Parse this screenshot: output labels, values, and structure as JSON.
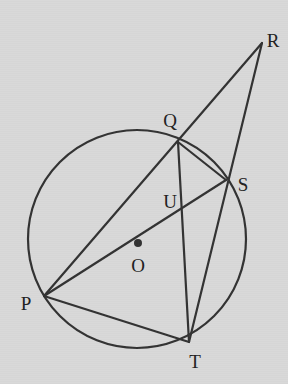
{
  "figure": {
    "type": "euclidean-geometry-diagram",
    "background_color": "#d9d9d9",
    "stroke_color": "#333333",
    "label_color": "#222222",
    "width": 288,
    "height": 384
  },
  "circle": {
    "name": "circumscribed-circle",
    "center_x": 137,
    "center_y": 239,
    "radius": 109,
    "stroke_width": 2.2
  },
  "center_marker": {
    "name": "center-dot",
    "x": 138,
    "y": 243,
    "radius": 4
  },
  "points": [
    {
      "id": "P",
      "label": "P",
      "x": 44,
      "y": 296,
      "label_x": 26,
      "label_y": 303,
      "on_circle": true
    },
    {
      "id": "Q",
      "label": "Q",
      "x": 178,
      "y": 142,
      "label_x": 170,
      "label_y": 120,
      "on_circle": true
    },
    {
      "id": "S",
      "label": "S",
      "x": 226,
      "y": 180,
      "label_x": 243,
      "label_y": 184,
      "on_circle": true
    },
    {
      "id": "T",
      "label": "T",
      "x": 189,
      "y": 342,
      "label_x": 195,
      "label_y": 361,
      "on_circle": true
    },
    {
      "id": "R",
      "label": "R",
      "x": 262,
      "y": 43,
      "label_x": 273,
      "label_y": 40,
      "on_circle": false
    },
    {
      "id": "U",
      "label": "U",
      "x": 180,
      "y": 208,
      "label_x": 170,
      "label_y": 201,
      "on_circle": false
    },
    {
      "id": "O",
      "label": "O",
      "x": 138,
      "y": 243,
      "label_x": 138,
      "label_y": 265,
      "on_circle": false
    }
  ],
  "segments": [
    {
      "name": "segment-P-R",
      "from": "P",
      "to": "R",
      "x1": 44,
      "y1": 296,
      "x2": 262,
      "y2": 43
    },
    {
      "name": "segment-T-R",
      "from": "T",
      "to": "R",
      "x1": 189,
      "y1": 342,
      "x2": 262,
      "y2": 43
    },
    {
      "name": "segment-P-S",
      "from": "P",
      "to": "S",
      "x1": 44,
      "y1": 296,
      "x2": 226,
      "y2": 180
    },
    {
      "name": "segment-Q-T",
      "from": "Q",
      "to": "T",
      "x1": 178,
      "y1": 142,
      "x2": 189,
      "y2": 342
    },
    {
      "name": "segment-P-T",
      "from": "P",
      "to": "T",
      "x1": 44,
      "y1": 296,
      "x2": 189,
      "y2": 342
    },
    {
      "name": "segment-Q-S",
      "from": "Q",
      "to": "S",
      "x1": 178,
      "y1": 142,
      "x2": 226,
      "y2": 180
    }
  ],
  "chart_data": {
    "type": "diagram",
    "title": "",
    "circle": {
      "center": [
        137,
        239
      ],
      "radius": 109,
      "center_label": "O"
    },
    "points_on_circle": [
      "P",
      "Q",
      "S",
      "T"
    ],
    "interior_points": [
      "O",
      "U"
    ],
    "exterior_points": [
      "R"
    ],
    "coordinates": {
      "P": [
        44,
        296
      ],
      "Q": [
        178,
        142
      ],
      "S": [
        226,
        180
      ],
      "T": [
        189,
        342
      ],
      "R": [
        262,
        43
      ],
      "U": [
        180,
        208
      ],
      "O": [
        138,
        243
      ]
    },
    "connections": [
      [
        "P",
        "R"
      ],
      [
        "T",
        "R"
      ],
      [
        "P",
        "S"
      ],
      [
        "Q",
        "T"
      ],
      [
        "P",
        "T"
      ],
      [
        "Q",
        "S"
      ]
    ]
  }
}
